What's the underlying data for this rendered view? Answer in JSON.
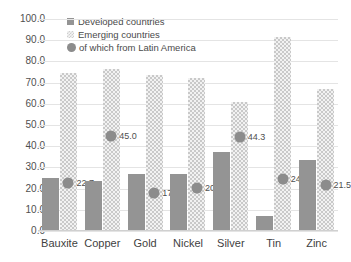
{
  "chart_data": {
    "type": "bar",
    "title": "",
    "xlabel": "",
    "ylabel": "",
    "ylim": [
      0,
      100
    ],
    "ytick_step": 10,
    "ytick_labels": [
      "0.0",
      "10.0",
      "20.0",
      "30.0",
      "40.0",
      "50.0",
      "60.0",
      "70.0",
      "80.0",
      "90.0",
      "100.0"
    ],
    "grid": true,
    "legend_position": "top-left",
    "categories": [
      "Bauxite",
      "Copper",
      "Gold",
      "Nickel",
      "Silver",
      "Tin",
      "Zinc"
    ],
    "series": [
      {
        "name": "Developed countries",
        "kind": "bar",
        "color": "#949494",
        "values": [
          25.0,
          23.5,
          26.8,
          27.0,
          37.4,
          7.0,
          33.5
        ]
      },
      {
        "name": "Emerging countries",
        "kind": "bar",
        "color": "#c9c9c9",
        "values": [
          74.5,
          76.5,
          73.5,
          72.0,
          61.0,
          91.5,
          67.0
        ]
      },
      {
        "name": "of which from Latin America",
        "kind": "marker",
        "color": "#8c8c8c",
        "values": [
          22.7,
          45.0,
          17.8,
          20.5,
          44.3,
          24.6,
          21.5
        ],
        "labels": [
          "22.7",
          "45.0",
          "17.8",
          "20.5",
          "44.3",
          "24.6",
          "21.5"
        ]
      }
    ]
  },
  "legend": {
    "items": [
      {
        "label": "Developed countries",
        "swatch": "square-solid-gray"
      },
      {
        "label": "Emerging countries",
        "swatch": "square-hatched-light"
      },
      {
        "label": "of which from Latin America",
        "swatch": "circle-gray"
      }
    ]
  },
  "colors": {
    "developed": "#949494",
    "emerging": "#c9c9c9",
    "latin_america": "#8c8c8c",
    "gridline": "#e4e4e4",
    "text": "#4a4a4a",
    "background": "#ffffff"
  }
}
